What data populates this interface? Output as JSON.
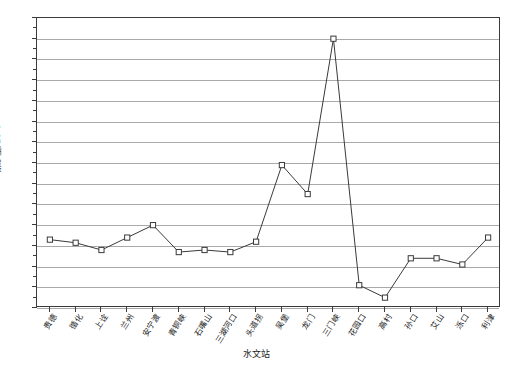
{
  "chart_data": {
    "type": "line",
    "title": "",
    "xlabel": "水文站",
    "ylabel": "输沙量/10⁸t",
    "ylim": [
      -3,
      11
    ],
    "ytick_step": 1,
    "grid": true,
    "legend": "none",
    "marker": "open-square",
    "line_color": "#3a3a3a",
    "grid_color": "#a9a9a9",
    "categories": [
      "贵德",
      "循化",
      "上诠",
      "兰州",
      "安宁渡",
      "青铜峡",
      "石嘴山",
      "三湖河口",
      "头道拐",
      "吴堡",
      "龙门",
      "三门峡",
      "花园口",
      "高村",
      "孙口",
      "艾山",
      "泺口",
      "利津"
    ],
    "values": [
      0.3,
      0.15,
      -0.2,
      0.4,
      1.0,
      -0.3,
      -0.2,
      -0.3,
      0.2,
      3.9,
      2.5,
      10.0,
      -1.9,
      -2.5,
      -0.6,
      -0.6,
      -0.9,
      0.4
    ],
    "yticks": [
      -3,
      -2,
      -1,
      0,
      1,
      2,
      3,
      4,
      5,
      6,
      7,
      8,
      9,
      10,
      11
    ]
  }
}
